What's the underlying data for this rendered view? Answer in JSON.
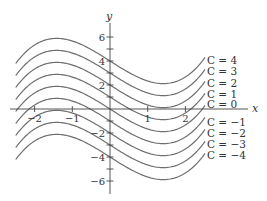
{
  "figure": {
    "axes": {
      "x_label": "x",
      "y_label": "y",
      "x_ticks": [
        {
          "value": -2,
          "label": "−2"
        },
        {
          "value": -1,
          "label": "−1"
        },
        {
          "value": 1,
          "label": "1"
        },
        {
          "value": 2,
          "label": "2"
        }
      ],
      "y_ticks": [
        {
          "value": 6,
          "label": "6"
        },
        {
          "value": 5,
          "label": ""
        },
        {
          "value": 4,
          "label": "4"
        },
        {
          "value": 3,
          "label": ""
        },
        {
          "value": 2,
          "label": "2"
        },
        {
          "value": 1,
          "label": ""
        },
        {
          "value": -1,
          "label": ""
        },
        {
          "value": -2,
          "label": "−2"
        },
        {
          "value": -3,
          "label": ""
        },
        {
          "value": -4,
          "label": "−4"
        },
        {
          "value": -5,
          "label": ""
        },
        {
          "value": -6,
          "label": "−6"
        }
      ],
      "x_range": [
        -2.75,
        3.65
      ],
      "y_range": [
        -7.0,
        7.2
      ]
    },
    "curves": [
      {
        "C": 4,
        "label": "C = 4"
      },
      {
        "C": 3,
        "label": "C = 3"
      },
      {
        "C": 2,
        "label": "C = 2"
      },
      {
        "C": 1,
        "label": "C = 1"
      },
      {
        "C": 0,
        "label": "C = 0"
      },
      {
        "C": -1,
        "label": "C = −1"
      },
      {
        "C": -2,
        "label": "C = −2"
      },
      {
        "C": -3,
        "label": "C = −3"
      },
      {
        "C": -4,
        "label": "C = −4"
      }
    ],
    "curve_domain": [
      -2.5,
      2.52
    ],
    "colors": {
      "curve": "#6e6e6e",
      "axis": "#444444",
      "text": "#333333"
    }
  }
}
